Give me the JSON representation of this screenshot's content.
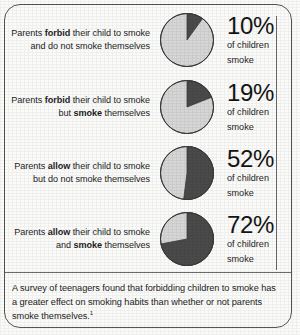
{
  "chart_data": {
    "type": "pie",
    "title": "",
    "legend": [
      {
        "label": "children who smoke",
        "color": "#4a4a4a"
      },
      {
        "label": "children who do not smoke",
        "color": "#d6d6d6"
      }
    ],
    "legend_position": "none",
    "series": [
      {
        "name": "Parents forbid their child to smoke and do not smoke themselves",
        "value": 10,
        "remainder": 90,
        "display": "10%"
      },
      {
        "name": "Parents forbid their child to smoke but smoke themselves",
        "value": 19,
        "remainder": 81,
        "display": "19%"
      },
      {
        "name": "Parents allow their child to smoke but do not smoke themselves",
        "value": 52,
        "remainder": 48,
        "display": "52%"
      },
      {
        "name": "Parents allow their child to smoke and smoke themselves",
        "value": 72,
        "remainder": 28,
        "display": "72%"
      }
    ],
    "units": "percent",
    "value_label_suffix": "of children smoke"
  },
  "rows": [
    {
      "label_html": "Parents <b>forbid</b> their child to smoke and do not smoke themselves",
      "percent": "10%",
      "sub_line1": "of children",
      "sub_line2": "smoke",
      "pie_value": 10
    },
    {
      "label_html": "Parents <b>forbid</b> their child to smoke but <b>smoke</b> themselves",
      "percent": "19%",
      "sub_line1": "of children",
      "sub_line2": "smoke",
      "pie_value": 19
    },
    {
      "label_html": "Parents <b>allow</b> their child to smoke but do not smoke themselves",
      "percent": "52%",
      "sub_line1": "of children",
      "sub_line2": "smoke",
      "pie_value": 52
    },
    {
      "label_html": "Parents <b>allow</b> their child to smoke and <b>smoke</b> themselves",
      "percent": "72%",
      "sub_line1": "of children",
      "sub_line2": "smoke",
      "pie_value": 72
    }
  ],
  "caption": {
    "text": "A survey of teenagers found that forbidding children to smoke has a greater effect on smoking habits than whether or not parents smoke themselves.",
    "footnote_marker": "1"
  },
  "colors": {
    "pie_dark": "#4a4a4a",
    "pie_light": "#d6d6d6",
    "pie_stroke": "#3a3a3a",
    "frame": "#555555",
    "rule": "#6b6b6b",
    "text": "#1d1d1d"
  }
}
